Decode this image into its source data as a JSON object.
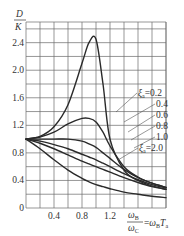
{
  "chart_data": {
    "type": "line",
    "title": "",
    "xlabel": "ωB/ωC = ωB·Ta",
    "ylabel": "D/K",
    "xlim": [
      0,
      2.0
    ],
    "ylim": [
      0,
      2.7
    ],
    "grid": true,
    "x_ticks": [
      "0.4",
      "0.8",
      "1.2"
    ],
    "y_ticks": [
      "0",
      "0.4",
      "0.8",
      "1.2",
      "1.6",
      "2.0",
      "2.4"
    ],
    "legend_position": "right, inline labels with leader lines",
    "legend_param": "ξa",
    "x": [
      0,
      0.2,
      0.4,
      0.6,
      0.8,
      0.9,
      1.0,
      1.1,
      1.2,
      1.4,
      1.6,
      1.8,
      2.0
    ],
    "series": [
      {
        "name": "ξa=0.2",
        "values": [
          1.0,
          1.04,
          1.18,
          1.5,
          2.1,
          2.4,
          2.45,
          1.8,
          1.0,
          0.55,
          0.4,
          0.32,
          0.27
        ]
      },
      {
        "name": "ξa=0.4",
        "values": [
          1.0,
          1.03,
          1.1,
          1.22,
          1.3,
          1.3,
          1.25,
          1.1,
          0.9,
          0.6,
          0.45,
          0.36,
          0.3
        ]
      },
      {
        "name": "ξa=0.6",
        "values": [
          1.0,
          1.0,
          1.0,
          1.0,
          0.97,
          0.93,
          0.88,
          0.8,
          0.72,
          0.56,
          0.44,
          0.36,
          0.3
        ]
      },
      {
        "name": "ξa=0.8",
        "values": [
          1.0,
          0.97,
          0.92,
          0.86,
          0.78,
          0.74,
          0.7,
          0.65,
          0.6,
          0.5,
          0.41,
          0.34,
          0.29
        ]
      },
      {
        "name": "ξa=1.0",
        "values": [
          1.0,
          0.94,
          0.86,
          0.77,
          0.68,
          0.64,
          0.6,
          0.56,
          0.52,
          0.44,
          0.37,
          0.31,
          0.27
        ]
      },
      {
        "name": "ξa=2.0",
        "values": [
          1.0,
          0.86,
          0.7,
          0.55,
          0.43,
          0.38,
          0.34,
          0.31,
          0.28,
          0.23,
          0.2,
          0.17,
          0.15
        ]
      }
    ]
  },
  "labels": {
    "y_title_num": "D",
    "y_title_den": "K",
    "x_title_num": "ω",
    "x_title_num_sub": "B",
    "x_title_den": "ω",
    "x_title_den_sub": "C",
    "x_title_rhs": "=ω",
    "x_title_rhs_sub": "B",
    "x_title_rhs_T": "T",
    "x_title_rhs_T_sub": "a",
    "legend": [
      "ξa=0.2",
      "0.4",
      "0.6",
      "0.8",
      "1.0",
      "ξa=2.0"
    ]
  }
}
